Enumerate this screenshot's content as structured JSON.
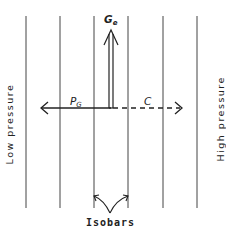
{
  "diagram": {
    "labels": {
      "low_pressure": "Low pressure",
      "high_pressure": "High pressure",
      "ge_main": "G",
      "ge_sub": "e",
      "pg_main": "P",
      "pg_sub": "G",
      "c": "C",
      "isobars": "Isobars"
    },
    "isobars_x": [
      26,
      60,
      94,
      128,
      163,
      197
    ],
    "colors": {
      "line": "#333333",
      "background": "#ffffff"
    }
  }
}
